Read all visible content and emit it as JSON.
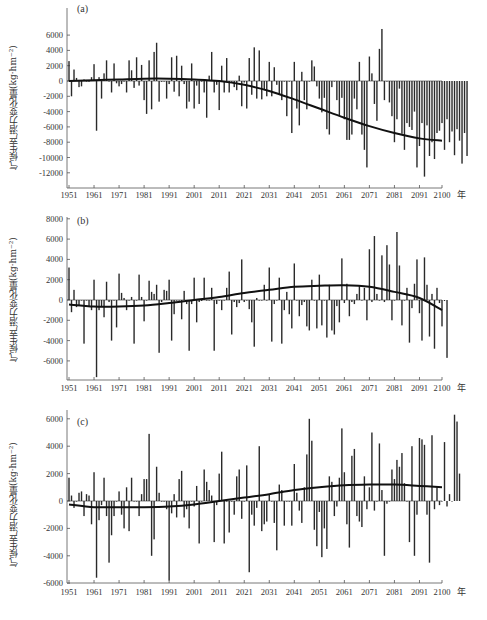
{
  "figure": {
    "panels_count": 3,
    "bar_color": "#2a2a2a",
    "trend_color": "#111111",
    "axis_color": "#555555"
  },
  "chart_data": [
    {
      "type": "bar",
      "panel_label": "(a)",
      "title": "",
      "xlabel": "年",
      "ylabel": "气候生产潜力变化量(kg·hm⁻²)",
      "x_tick_labels": [
        "1951",
        "1961",
        "1971",
        "1981",
        "1991",
        "2001",
        "2011",
        "2021",
        "2031",
        "2041",
        "2051",
        "2061",
        "2071",
        "2081",
        "2091",
        "2100"
      ],
      "y_tick_labels": [
        "6000",
        "4000",
        "2000",
        "0",
        "-2000",
        "-4000",
        "-6000",
        "-8000",
        "-10000",
        "-12000"
      ],
      "ylim": [
        -13800,
        7200
      ],
      "x_start": 1951,
      "x_end": 2100,
      "grid": false,
      "series": [
        {
          "name": "年际变化量",
          "values": [
            2600,
            -2000,
            1500,
            400,
            -800,
            -700,
            200,
            0,
            -100,
            500,
            2200,
            -6500,
            500,
            -2300,
            1000,
            2700,
            0,
            -1500,
            2300,
            -300,
            -700,
            -400,
            0,
            -1500,
            2700,
            1400,
            -900,
            3100,
            -600,
            2100,
            -2500,
            -4300,
            2700,
            -3700,
            3800,
            5000,
            -2700,
            -100,
            0,
            -2300,
            -400,
            3100,
            -1400,
            3300,
            -2000,
            2000,
            -400,
            -3600,
            -2700,
            2300,
            -3600,
            -600,
            -3000,
            0,
            -1500,
            -4800,
            700,
            3800,
            -1500,
            -500,
            -3800,
            2000,
            -1500,
            3000,
            -1500,
            -100,
            -800,
            -1200,
            700,
            -3300,
            -200,
            -3600,
            3000,
            -1800,
            4400,
            -2300,
            4000,
            -2400,
            -1200,
            -2000,
            2500,
            -2000,
            1800,
            -500,
            -1700,
            -2500,
            0,
            -4600,
            0,
            -6800,
            2500,
            -3600,
            -5800,
            1200,
            -2500,
            -3700,
            0,
            2700,
            1900,
            -700,
            -2300,
            -4100,
            -2200,
            -6300,
            -7000,
            -800,
            0,
            -2500,
            -4500,
            -2200,
            -5000,
            -7700,
            -7700,
            -7000,
            -2300,
            -3700,
            2500,
            -7000,
            -9000,
            -11300,
            3200,
            1000,
            -3000,
            -5200,
            4200,
            6800,
            -2500,
            0,
            -2800,
            -4600,
            -8000,
            -5000,
            -1000,
            -6900,
            -9000,
            -5500,
            -6000,
            -6400,
            -4000,
            -11300,
            -8500,
            -5500,
            -12500,
            -5800,
            -9800,
            -8000,
            -10200,
            -6800,
            -6500,
            -5500,
            -9000,
            -5000,
            -8000,
            -6600,
            -9700,
            -6300,
            -7800,
            -10800,
            -6800,
            -9800
          ],
          "color": "#2a2a2a"
        },
        {
          "name": "趋势线",
          "type": "line",
          "x": [
            1951,
            1961,
            1971,
            1981,
            1991,
            2001,
            2011,
            2021,
            2031,
            2041,
            2051,
            2061,
            2071,
            2081,
            2091,
            2100
          ],
          "values": [
            0,
            100,
            200,
            300,
            300,
            200,
            0,
            -500,
            -1300,
            -2400,
            -3600,
            -4800,
            -5900,
            -6800,
            -7500,
            -7800
          ],
          "color": "#111111"
        }
      ]
    },
    {
      "type": "bar",
      "panel_label": "(b)",
      "title": "",
      "xlabel": "年",
      "ylabel": "气候生产潜力变化量(kg·hm⁻²)",
      "x_tick_labels": [
        "1951",
        "1961",
        "1971",
        "1981",
        "1991",
        "2001",
        "2011",
        "2021",
        "2031",
        "2041",
        "2051",
        "2061",
        "2071",
        "2081",
        "2091",
        "2100"
      ],
      "y_tick_labels": [
        "8000",
        "6000",
        "4000",
        "2000",
        "0",
        "-2000",
        "-4000",
        "-6000"
      ],
      "ylim": [
        -7800,
        8000
      ],
      "x_start": 1951,
      "x_end": 2100,
      "grid": false,
      "series": [
        {
          "name": "年际变化量",
          "values": [
            3200,
            -1200,
            1000,
            -700,
            -500,
            0,
            -4300,
            0,
            -600,
            -1000,
            2000,
            -7600,
            -1000,
            -600,
            -1700,
            1800,
            -200,
            -4000,
            0,
            -2700,
            2600,
            700,
            200,
            -1000,
            0,
            300,
            -4300,
            0,
            2500,
            300,
            -2100,
            0,
            1900,
            800,
            600,
            1500,
            -5200,
            -200,
            1000,
            900,
            2000,
            -4000,
            -1400,
            0,
            0,
            -1900,
            900,
            -400,
            -5000,
            -400,
            2200,
            -2200,
            -200,
            -100,
            2200,
            0,
            0,
            1200,
            -5000,
            -400,
            0,
            -1000,
            0,
            1200,
            2800,
            -3400,
            -200,
            -700,
            -300,
            4000,
            -200,
            0,
            -900,
            -2200,
            -4600,
            200,
            0,
            0,
            1500,
            0,
            3200,
            -4100,
            -400,
            0,
            2200,
            -4300,
            -1000,
            800,
            -1400,
            -2800,
            3600,
            0,
            -1600,
            -500,
            -200,
            -2600,
            -3000,
            2000,
            0,
            -2800,
            2500,
            -2500,
            0,
            -3700,
            1500,
            -3000,
            -3400,
            -600,
            -2200,
            4100,
            -300,
            1600,
            -1600,
            -200,
            -400,
            600,
            1400,
            0,
            1200,
            -2000,
            5000,
            -200,
            6300,
            600,
            0,
            4400,
            -200,
            5400,
            3500,
            -2000,
            0,
            6700,
            3400,
            -2500,
            0,
            1200,
            -4200,
            -800,
            1600,
            4000,
            -1300,
            -4000,
            4200,
            1500,
            -3600,
            600,
            -4800,
            1200,
            -300,
            -2600,
            -100,
            -5700
          ],
          "color": "#2a2a2a"
        },
        {
          "name": "趋势线",
          "type": "line",
          "x": [
            1951,
            1961,
            1971,
            1981,
            1991,
            2001,
            2011,
            2021,
            2031,
            2041,
            2051,
            2061,
            2071,
            2081,
            2091,
            2100
          ],
          "values": [
            -450,
            -650,
            -650,
            -550,
            -300,
            0,
            300,
            700,
            1000,
            1300,
            1400,
            1450,
            1300,
            800,
            200,
            -1000
          ],
          "color": "#111111"
        }
      ]
    },
    {
      "type": "bar",
      "panel_label": "(c)",
      "title": "",
      "xlabel": "年",
      "ylabel": "气候生产潜力变化量(kg·hm⁻²)",
      "x_tick_labels": [
        "1951",
        "1961",
        "1971",
        "1981",
        "1991",
        "2001",
        "2011",
        "2021",
        "2031",
        "2041",
        "2051",
        "2061",
        "2071",
        "2081",
        "2091",
        "2100"
      ],
      "y_tick_labels": [
        "6000",
        "4000",
        "2000",
        "0",
        "-2000",
        "-4000",
        "-6000"
      ],
      "ylim": [
        -6000,
        6200
      ],
      "x_start": 1951,
      "x_end": 2100,
      "grid": false,
      "series": [
        {
          "name": "年际变化量",
          "values": [
            1700,
            400,
            -500,
            0,
            600,
            700,
            -1100,
            500,
            400,
            -1700,
            2100,
            -5600,
            -1400,
            -300,
            1700,
            -1100,
            -4500,
            -2500,
            -1100,
            0,
            700,
            -1000,
            -2000,
            1000,
            -2200,
            1700,
            0,
            0,
            -1100,
            500,
            1600,
            1600,
            4900,
            -4000,
            -2800,
            2500,
            600,
            0,
            0,
            -600,
            -5800,
            -900,
            500,
            -1200,
            1600,
            2200,
            -1200,
            -600,
            -2000,
            0,
            -400,
            1100,
            -3100,
            0,
            2300,
            1400,
            800,
            400,
            -3000,
            -300,
            2000,
            3600,
            -3100,
            0,
            -2300,
            0,
            -1000,
            1800,
            2300,
            -1300,
            0,
            2600,
            -5200,
            -1000,
            -1800,
            -500,
            4000,
            -2200,
            -1700,
            -1500,
            500,
            0,
            -1600,
            -3600,
            1200,
            800,
            -1800,
            0,
            0,
            -1800,
            2700,
            600,
            -700,
            -1600,
            1000,
            3400,
            6000,
            4400,
            -2100,
            -3300,
            -800,
            -4100,
            -2000,
            -3500,
            1800,
            1400,
            -1100,
            -400,
            1700,
            5300,
            2100,
            -1700,
            -3400,
            3300,
            3800,
            -1100,
            -1500,
            -1900,
            1800,
            -600,
            1000,
            5000,
            -700,
            0,
            4200,
            800,
            -4000,
            -200,
            0,
            2300,
            1600,
            3000,
            2500,
            3500,
            1300,
            0,
            -3000,
            4000,
            -4000,
            -1000,
            4600,
            4500,
            4100,
            -1000,
            -4500,
            4800,
            -600,
            1000,
            -300,
            0,
            4300,
            -400,
            500,
            0,
            6300,
            5800,
            2000
          ],
          "color": "#2a2a2a"
        },
        {
          "name": "趋势线",
          "type": "line",
          "x": [
            1951,
            1961,
            1971,
            1981,
            1991,
            2001,
            2011,
            2021,
            2031,
            2041,
            2051,
            2061,
            2071,
            2081,
            2091,
            2100
          ],
          "values": [
            -250,
            -450,
            -450,
            -450,
            -400,
            -250,
            0,
            250,
            500,
            800,
            1000,
            1150,
            1200,
            1200,
            1100,
            1000
          ],
          "color": "#111111"
        }
      ]
    }
  ]
}
